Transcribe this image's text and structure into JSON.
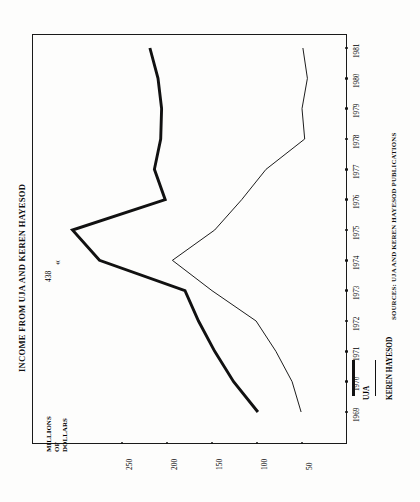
{
  "title": "INCOME FROM UJA AND KEREN HAYESOD",
  "sources": "SOURCES: UJA AND KEREN HAYESOD PUBLICATIONS",
  "axis": {
    "value_caption_lines": [
      "MILLIONS",
      "OF",
      "DOLLARS"
    ],
    "value_ticks": [
      "250",
      "200",
      "150",
      "100",
      "50"
    ],
    "year_ticks": [
      "1969",
      "1970",
      "1971",
      "1972",
      "1973",
      "1974",
      "1975",
      "1976",
      "1977",
      "1978",
      "1979",
      "1980",
      "1981"
    ]
  },
  "annotation": {
    "peak_value": "438",
    "arrow_glyph": "«"
  },
  "legend": {
    "items": [
      {
        "label": "UJA",
        "style": "thick",
        "color": "#111111"
      },
      {
        "label": "KEREN HAYESOD",
        "style": "thin",
        "color": "#111111"
      }
    ]
  },
  "chart_data": {
    "type": "line",
    "title": "INCOME FROM UJA AND KEREN HAYESOD",
    "orientation": "rotated-90-ccw",
    "xlabel": "",
    "ylabel": "MILLIONS OF DOLLARS",
    "categories": [
      1969,
      1970,
      1971,
      1972,
      1973,
      1974,
      1975,
      1976,
      1977,
      1978,
      1979,
      1980,
      1981
    ],
    "ylim": [
      0,
      275
    ],
    "yticks": [
      50,
      100,
      150,
      200,
      250
    ],
    "grid": false,
    "legend_position": "bottom-right",
    "annotations": [
      {
        "text": "438",
        "x": 1974,
        "y": 275,
        "note": "UJA peak value exceeds axis; labeled 438"
      }
    ],
    "series": [
      {
        "name": "UJA",
        "linewidth": "thick",
        "color": "#111111",
        "values": [
          99,
          126,
          147,
          165,
          180,
          275,
          305,
          202,
          214,
          207,
          206,
          210,
          219
        ],
        "values_note": "1974 value is off-scale and annotated as 438"
      },
      {
        "name": "KEREN HAYESOD",
        "linewidth": "thin",
        "color": "#111111",
        "values": [
          51,
          61,
          79,
          101,
          150,
          194,
          147,
          117,
          90,
          47,
          50,
          44,
          49
        ]
      }
    ]
  }
}
